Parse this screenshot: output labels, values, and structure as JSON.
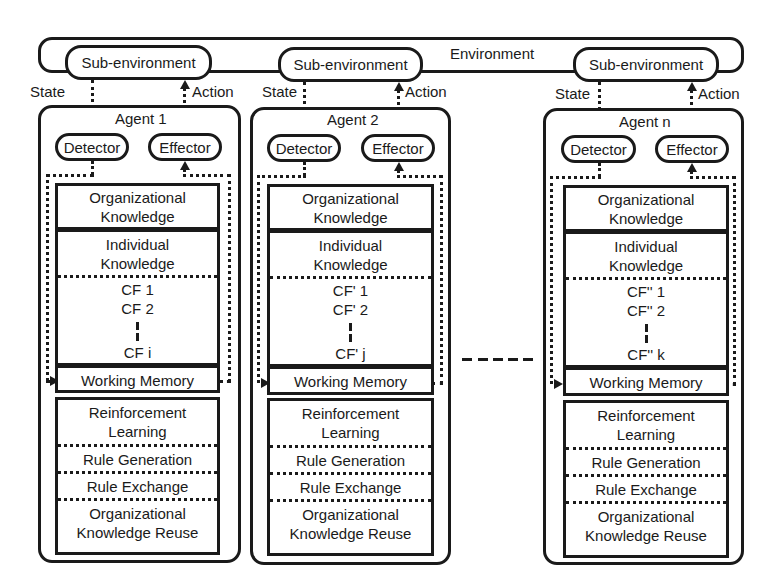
{
  "environment": {
    "label": "Environment"
  },
  "agents": [
    {
      "title": "Agent 1",
      "sub_environment": "Sub-environment",
      "state_label": "State",
      "action_label": "Action",
      "detector": "Detector",
      "effector": "Effector",
      "organizational_knowledge": [
        "Organizational",
        "Knowledge"
      ],
      "individual_knowledge": [
        "Individual",
        "Knowledge"
      ],
      "cf_items": [
        "CF 1",
        "CF 2",
        "CF i"
      ],
      "working_memory": "Working Memory",
      "learning": {
        "reinforcement": [
          "Reinforcement",
          "Learning"
        ],
        "rule_generation": "Rule Generation",
        "rule_exchange": "Rule Exchange",
        "org_reuse": [
          "Organizational",
          "Knowledge Reuse"
        ]
      }
    },
    {
      "title": "Agent 2",
      "sub_environment": "Sub-environment",
      "state_label": "State",
      "action_label": "Action",
      "detector": "Detector",
      "effector": "Effector",
      "organizational_knowledge": [
        "Organizational",
        "Knowledge"
      ],
      "individual_knowledge": [
        "Individual",
        "Knowledge"
      ],
      "cf_items": [
        "CF' 1",
        "CF' 2",
        "CF' j"
      ],
      "working_memory": "Working Memory",
      "learning": {
        "reinforcement": [
          "Reinforcement",
          "Learning"
        ],
        "rule_generation": "Rule Generation",
        "rule_exchange": "Rule Exchange",
        "org_reuse": [
          "Organizational",
          "Knowledge Reuse"
        ]
      }
    },
    {
      "title": "Agent n",
      "sub_environment": "Sub-environment",
      "state_label": "State",
      "action_label": "Action",
      "detector": "Detector",
      "effector": "Effector",
      "organizational_knowledge": [
        "Organizational",
        "Knowledge"
      ],
      "individual_knowledge": [
        "Individual",
        "Knowledge"
      ],
      "cf_items": [
        "CF'' 1",
        "CF'' 2",
        "CF'' k"
      ],
      "working_memory": "Working Memory",
      "learning": {
        "reinforcement": [
          "Reinforcement",
          "Learning"
        ],
        "rule_generation": "Rule Generation",
        "rule_exchange": "Rule Exchange",
        "org_reuse": [
          "Organizational",
          "Knowledge Reuse"
        ]
      }
    }
  ]
}
